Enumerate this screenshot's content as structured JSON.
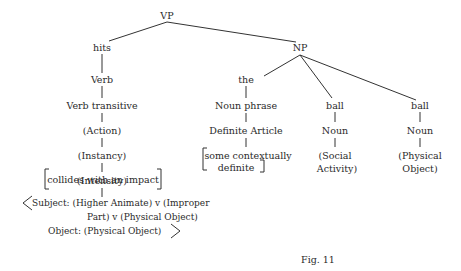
{
  "diagram": {
    "root": "VP",
    "verb_branch": {
      "word": "hits",
      "nodes": [
        "Verb",
        "Verb transitive",
        "(Action)",
        "(Instancy)",
        "(Intensity)"
      ],
      "distinguisher": "collides with an impact",
      "restriction": {
        "line1": "Subject:  (Higher Animate)  v  (Improper",
        "line2": "Part)  v  (Physical Object)",
        "line3": "Object:  (Physical Object)"
      }
    },
    "np": {
      "label": "NP",
      "the": {
        "word": "the",
        "nodes": [
          "Noun phrase",
          "Definite Article"
        ],
        "distinguisher_line1": "some contextually",
        "distinguisher_line2": "definite"
      },
      "ball1": {
        "word": "ball",
        "nodes": [
          "Noun"
        ],
        "marker_line1": "(Social",
        "marker_line2": "Activity)"
      },
      "ball2": {
        "word": "ball",
        "nodes": [
          "Noun"
        ],
        "marker_line1": "(Physical",
        "marker_line2": "Object)"
      }
    },
    "caption": "Fig.  11"
  }
}
